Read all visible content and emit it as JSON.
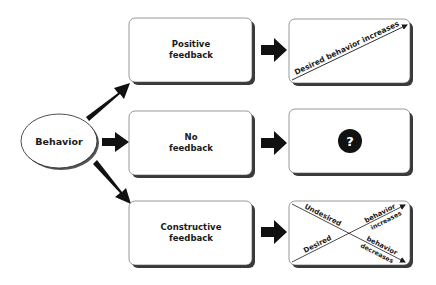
{
  "diagram": {
    "root": {
      "label": "Behavior"
    },
    "branches": [
      {
        "feedback_line1": "Positive",
        "feedback_line2": "feedback",
        "outcome": {
          "type": "rising-line",
          "text": "Desired behavior increases"
        }
      },
      {
        "feedback_line1": "No",
        "feedback_line2": "feedback",
        "outcome": {
          "type": "question",
          "symbol": "?"
        }
      },
      {
        "feedback_line1": "Constructive",
        "feedback_line2": "feedback",
        "outcome": {
          "type": "cross",
          "undesired": "Undesired",
          "desired": "Desired",
          "increases_top": "behavior",
          "increases_bottom": "increases",
          "decreases_top": "behavior",
          "decreases_bottom": "decreases"
        }
      }
    ],
    "colors": {
      "fill": "#ffffff",
      "stroke": "#1a1a1a",
      "shadow": "#3a3a3a",
      "arrow": "#111111"
    }
  }
}
